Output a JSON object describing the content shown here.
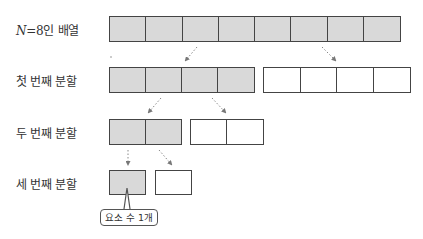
{
  "rows": [
    {
      "label_var": "N",
      "label_eq": "=8",
      "label_rest": "인 배열",
      "label": "N=8인 배열",
      "left": {
        "cells": 8,
        "fill": "gray"
      },
      "right": null
    },
    {
      "label": "첫 번째 분할",
      "left": {
        "cells": 4,
        "fill": "gray"
      },
      "right": {
        "cells": 4,
        "fill": "white"
      }
    },
    {
      "label": "두 번째 분할",
      "left": {
        "cells": 2,
        "fill": "gray"
      },
      "right": {
        "cells": 2,
        "fill": "white"
      }
    },
    {
      "label": "세 번째 분할",
      "left": {
        "cells": 1,
        "fill": "gray"
      },
      "right": {
        "cells": 1,
        "fill": "white"
      }
    }
  ],
  "callout": {
    "text": "요소 수 1개"
  },
  "colors": {
    "gray_fill": "#d9d9d9",
    "border": "#444444",
    "arrow": "#777777"
  }
}
